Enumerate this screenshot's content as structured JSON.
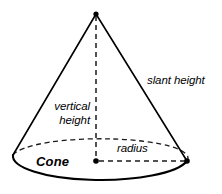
{
  "figure": {
    "title": "Cone",
    "shape_name": "cone",
    "background_color": "#ffffff",
    "stroke_color": "#000000",
    "width": 222,
    "height": 194
  },
  "labels": {
    "shape": "Cone",
    "slant_height": "slant height",
    "vertical_height_line1": "vertical",
    "vertical_height_line2": "height",
    "radius": "radius"
  },
  "geometry": {
    "apex": {
      "x": 96,
      "y": 14
    },
    "base_center": {
      "x": 99,
      "y": 161
    },
    "base_radius_x": 87,
    "base_radius_y": 19,
    "left_base_point": {
      "x": 13,
      "y": 155
    },
    "right_base_point": {
      "x": 187,
      "y": 161
    },
    "markers": [
      {
        "name": "apex-dot",
        "x": 96,
        "y": 14
      },
      {
        "name": "center-dot",
        "x": 96,
        "y": 161
      },
      {
        "name": "right-edge-dot",
        "x": 187,
        "y": 161
      }
    ],
    "dashed_segments": [
      "vertical-height-line",
      "radius-line",
      "base-back-arc"
    ],
    "solid_segments": [
      "left-slant-line",
      "right-slant-line",
      "base-front-arc"
    ]
  }
}
